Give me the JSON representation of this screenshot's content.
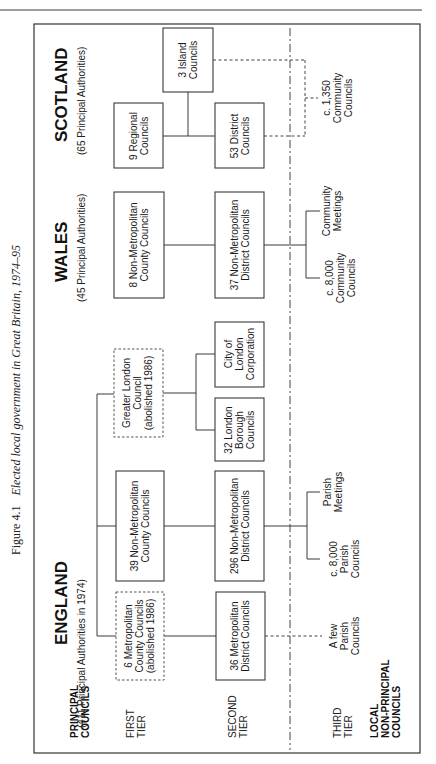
{
  "figure": {
    "number": "Figure 4.1",
    "title": "Elected local government in Great Britain, 1974–95"
  },
  "row_labels": {
    "principal": [
      "PRINCIPAL",
      "COUNCILS"
    ],
    "first_tier": [
      "FIRST",
      "TIER"
    ],
    "second_tier": [
      "SECOND",
      "TIER"
    ],
    "third_tier": [
      "THIRD",
      "TIER"
    ],
    "local": [
      "LOCAL",
      "NON-PRINCIPAL",
      "COUNCILS"
    ]
  },
  "countries": {
    "england": {
      "name": "ENGLAND",
      "subtitle": "(411 Principal Authorities in 1974)",
      "first_tier": [
        {
          "lines": [
            "6 Metropolitan",
            "County Councils",
            "(abolished 1986)"
          ],
          "abolished": true
        },
        {
          "lines": [
            "39 Non-Metropolitan",
            "County Councils"
          ],
          "abolished": false
        },
        {
          "lines": [
            "Greater London",
            "Council",
            "(abolished 1986)"
          ],
          "abolished": true
        }
      ],
      "second_tier": [
        {
          "lines": [
            "36 Metropolitan",
            "District Councils"
          ]
        },
        {
          "lines": [
            "296 Non-Metropolitan",
            "District Councils"
          ]
        },
        {
          "lines": [
            "32 London",
            "Borough",
            "Councils"
          ]
        },
        {
          "lines": [
            "City of",
            "London",
            "Corporation"
          ]
        }
      ],
      "third_tier": [
        {
          "lines": [
            "A few",
            "Parish",
            "Councils"
          ]
        },
        {
          "lines": [
            "c. 8,000",
            "Parish",
            "Councils"
          ]
        },
        {
          "lines": [
            "Parish",
            "Meetings"
          ]
        }
      ]
    },
    "wales": {
      "name": "WALES",
      "subtitle": "(45 Principal Authorities)",
      "first_tier": [
        {
          "lines": [
            "8 Non-Metropolitan",
            "County Councils"
          ]
        }
      ],
      "second_tier": [
        {
          "lines": [
            "37 Non-Metropolitan",
            "District Councils"
          ]
        }
      ],
      "third_tier": [
        {
          "lines": [
            "c. 8,000",
            "Community",
            "Councils"
          ]
        },
        {
          "lines": [
            "Community",
            "Meetings"
          ]
        }
      ]
    },
    "scotland": {
      "name": "SCOTLAND",
      "subtitle": "(65 Principal Authorities)",
      "first_tier": [
        {
          "lines": [
            "9  Regional",
            "Councils"
          ]
        },
        {
          "lines": [
            "3 Island",
            "Councils"
          ]
        }
      ],
      "second_tier": [
        {
          "lines": [
            "53 District",
            "Councils"
          ]
        }
      ],
      "third_tier": [
        {
          "lines": [
            "c. 1,350",
            "Community",
            "Councils"
          ]
        }
      ]
    }
  },
  "legend_notes": {
    "dashed_box": "abolished 1986"
  }
}
